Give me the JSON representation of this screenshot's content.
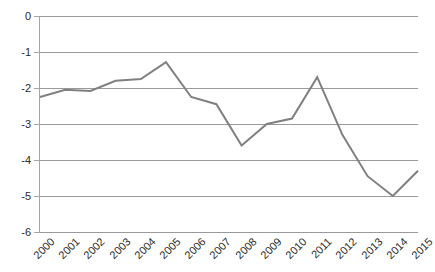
{
  "chart_data": {
    "type": "line",
    "title": "",
    "subtitle": "",
    "xlabel": "",
    "ylabel": "",
    "categories": [
      "2000",
      "2001",
      "2002",
      "2003",
      "2004",
      "2005",
      "2006",
      "2007",
      "2008",
      "2009",
      "2010",
      "2011",
      "2012",
      "2013",
      "2014",
      "2015"
    ],
    "values": [
      -2.25,
      -2.05,
      -2.08,
      -1.8,
      -1.75,
      -1.28,
      -2.25,
      -2.45,
      -3.6,
      -3.0,
      -2.85,
      -1.7,
      -3.3,
      -4.45,
      -5.0,
      -4.3
    ],
    "series": [
      {
        "name": "series-1",
        "color": "#808080",
        "values": [
          -2.25,
          -2.05,
          -2.08,
          -1.8,
          -1.75,
          -1.28,
          -2.25,
          -2.45,
          -3.6,
          -3.0,
          -2.85,
          -1.7,
          -3.3,
          -4.45,
          -5.0,
          -4.3
        ]
      }
    ],
    "ylim": [
      -6,
      0
    ],
    "ytick_labels": [
      "0",
      "-1",
      "-2",
      "-3",
      "-4",
      "-5",
      "-6"
    ],
    "ytick_values": [
      0,
      -1,
      -2,
      -3,
      -4,
      -5,
      -6
    ],
    "xtick_labels": [
      "2000",
      "2001",
      "2002",
      "2003",
      "2004",
      "2005",
      "2006",
      "2007",
      "2008",
      "2009",
      "2010",
      "2011",
      "2012",
      "2013",
      "2014",
      "2015"
    ],
    "grid": true,
    "grid_orientation": "horizontal",
    "legend": false,
    "legend_position": "none",
    "annotations": [],
    "colors": {
      "line": "#808080",
      "gridline": "#9a9a9a",
      "axis": "#a6a6a6",
      "tick_text": "#2b2b2b",
      "background": "#ffffff"
    },
    "line_width": 2,
    "markers": false,
    "xtick_label_rotation": -45
  }
}
